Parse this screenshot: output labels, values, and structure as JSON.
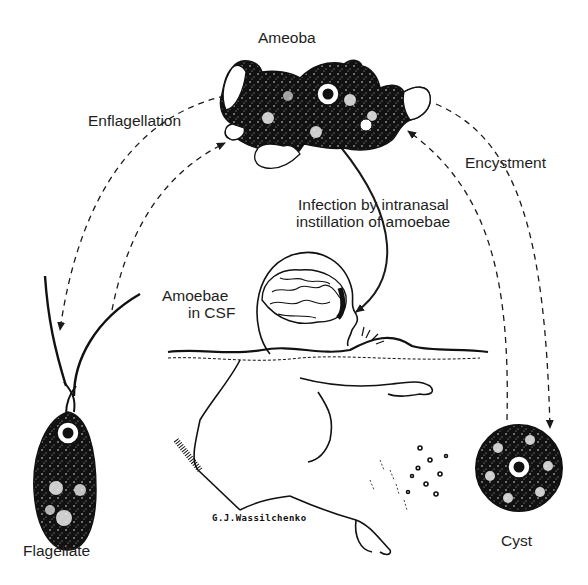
{
  "diagram": {
    "stages": {
      "ameoba": "Ameoba",
      "flagellate": "Flagellate",
      "cyst": "Cyst"
    },
    "transitions": {
      "enflagellation": "Enflagellation",
      "encystment": "Encystment",
      "infection_line1": "Infection by intranasal",
      "infection_line2": "instillation of amoebae"
    },
    "host_label_line1": "Amoebae",
    "host_label_line2": "in CSF",
    "signature": "G.J.Wassilchenko"
  }
}
